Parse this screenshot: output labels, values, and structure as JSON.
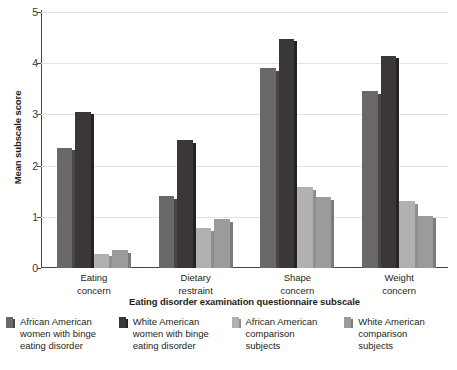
{
  "chart_data": {
    "type": "bar",
    "title": "",
    "subtitle": "",
    "xlabel": "Eating disorder examination questionnaire subscale",
    "ylabel": "Mean subscale score",
    "categories": [
      "Eating concern",
      "Dietary restraint",
      "Shape concern",
      "Weight concern"
    ],
    "category_lines": [
      [
        "Eating",
        "concern"
      ],
      [
        "Dietary",
        "restraint"
      ],
      [
        "Shape",
        "concern"
      ],
      [
        "Weight",
        "concern"
      ]
    ],
    "series": [
      {
        "name": "African American women with binge eating disorder",
        "name_lines": [
          "African American",
          "women with binge",
          "eating disorder"
        ],
        "color": "#6b6869",
        "edge_color": "#4a4648",
        "values": [
          2.35,
          1.4,
          3.9,
          3.45
        ]
      },
      {
        "name": "White American women with binge eating disorder",
        "name_lines": [
          "White American",
          "women with binge",
          "eating disorder"
        ],
        "color": "#3b3738",
        "edge_color": "#262324",
        "values": [
          3.05,
          2.5,
          4.48,
          4.15
        ]
      },
      {
        "name": "African American comparison subjects",
        "name_lines": [
          "African American",
          "comparison",
          "subjects"
        ],
        "color": "#b3b0b1",
        "edge_color": "#918e8f",
        "values": [
          0.28,
          0.78,
          1.58,
          1.3
        ]
      },
      {
        "name": "White American comparison subjects",
        "name_lines": [
          "White American",
          "comparison",
          "subjects"
        ],
        "color": "#9d9a9b",
        "edge_color": "#7d7a7b",
        "values": [
          0.35,
          0.95,
          1.38,
          1.02
        ]
      }
    ],
    "ylim": [
      0,
      5
    ],
    "yticks": [
      0,
      1,
      2,
      3,
      4,
      5
    ],
    "ytick_labels": [
      "0",
      "1",
      "2",
      "3",
      "4",
      "5"
    ],
    "grid": true,
    "grid_color": "#e3e1e2",
    "axis_color": "#4a4548",
    "legend_position": "bottom",
    "legend_columns": 4
  }
}
